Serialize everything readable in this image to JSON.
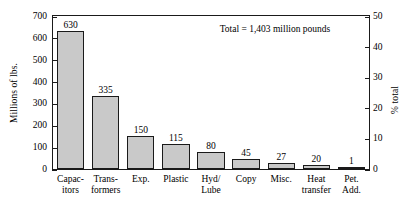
{
  "chart_data": {
    "type": "bar",
    "title": "",
    "subtitle": "",
    "xlabel": "",
    "ylabel": "Millions of lbs.",
    "y2label": "% total",
    "ylim": [
      0,
      700
    ],
    "y2lim": [
      0,
      50
    ],
    "yticks": [
      0,
      100,
      200,
      300,
      400,
      500,
      600,
      700
    ],
    "y2ticks": [
      0,
      10,
      20,
      30,
      40,
      50
    ],
    "grid": false,
    "legend": null,
    "categories": [
      "Capac-\nitors",
      "Trans-\nformers",
      "Exp.",
      "Plastic",
      "Hyd/\nLube",
      "Copy",
      "Misc.",
      "Heat\ntransfer",
      "Pet.\nAdd."
    ],
    "category_lines": [
      [
        "Capac-",
        "itors"
      ],
      [
        "Trans-",
        "formers"
      ],
      [
        "Exp.",
        ""
      ],
      [
        "Plastic",
        ""
      ],
      [
        "Hyd/",
        "Lube"
      ],
      [
        "Copy",
        ""
      ],
      [
        "Misc.",
        ""
      ],
      [
        "Heat",
        "transfer"
      ],
      [
        "Pet.",
        "Add."
      ]
    ],
    "values": [
      630,
      335,
      150,
      115,
      80,
      45,
      27,
      20,
      1
    ],
    "value_labels": [
      "630",
      "335",
      "150",
      "115",
      "80",
      "45",
      "27",
      "20",
      "1"
    ],
    "annotations": [
      {
        "text": "Total = 1,403 million pounds"
      }
    ],
    "bar_fill_color": "#c9c9c9",
    "bar_edge_color": "#1a1a1a",
    "axis_color": "#1a1a1a"
  }
}
